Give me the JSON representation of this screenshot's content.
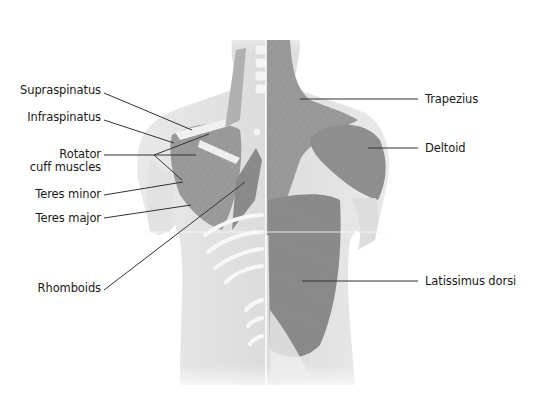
{
  "diagram": {
    "colors": {
      "background": "#ffffff",
      "skin": "#e6e6e6",
      "muscle_dark": "#8c8c8c",
      "muscle_mid": "#a8a8a8",
      "bone": "#f2f2f2",
      "leader_line": "#333333",
      "text": "#1a1a1a"
    },
    "labels_left": [
      {
        "id": "supraspinatus",
        "text": "Supraspinatus"
      },
      {
        "id": "infraspinatus",
        "text": "Infraspinatus"
      },
      {
        "id": "rotator-line1",
        "text": "Rotator"
      },
      {
        "id": "rotator-line2",
        "text": "cuff muscles"
      },
      {
        "id": "teres-minor",
        "text": "Teres minor"
      },
      {
        "id": "teres-major",
        "text": "Teres major"
      },
      {
        "id": "rhomboids",
        "text": "Rhomboids"
      }
    ],
    "labels_right": [
      {
        "id": "trapezius",
        "text": "Trapezius"
      },
      {
        "id": "deltoid",
        "text": "Deltoid"
      },
      {
        "id": "latissimus-dorsi",
        "text": "Latissimus dorsi"
      }
    ]
  }
}
